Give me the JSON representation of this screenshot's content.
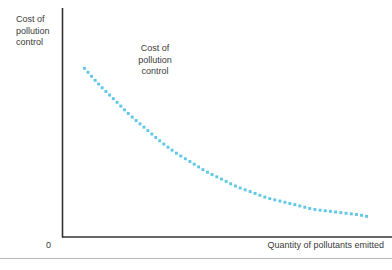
{
  "figure": {
    "background_color": "#ffffff",
    "axis_color": "#333333",
    "curve_color": "#5FC8E6",
    "text_color": "#3a3a3a",
    "rule_color": "#b9b9b9"
  },
  "labels": {
    "y_axis": "Cost of\npollution\ncontrol",
    "x_axis": "Quantity of pollutants emitted",
    "origin": "0",
    "curve_annotation": "Cost of\npollution\ncontrol"
  },
  "chart_data": {
    "type": "line",
    "title": "",
    "subtitle": "",
    "xlabel": "Quantity of pollutants emitted",
    "ylabel": "Cost of pollution control",
    "grid": false,
    "legend": null,
    "axis_style": "L-shaped open axes, no tick marks, no numeric scale",
    "origin_label": "0",
    "xlim": [
      0,
      100
    ],
    "ylim": [
      0,
      100
    ],
    "annotations": [
      {
        "text": "Cost of pollution control",
        "x": 22,
        "y": 84,
        "align": "center"
      }
    ],
    "series": [
      {
        "name": "Cost of pollution control",
        "color": "#5FC8E6",
        "style": "dotted",
        "marker": "square",
        "x": [
          7,
          12,
          17,
          22,
          27,
          32,
          37,
          42,
          47,
          52,
          57,
          62,
          67,
          72,
          77,
          82,
          87,
          92,
          97,
          100
        ],
        "y": [
          85,
          76,
          68,
          60,
          53,
          46,
          40,
          35,
          30,
          26,
          22,
          19,
          16,
          14,
          12,
          10,
          9,
          8,
          7,
          6
        ]
      }
    ]
  }
}
